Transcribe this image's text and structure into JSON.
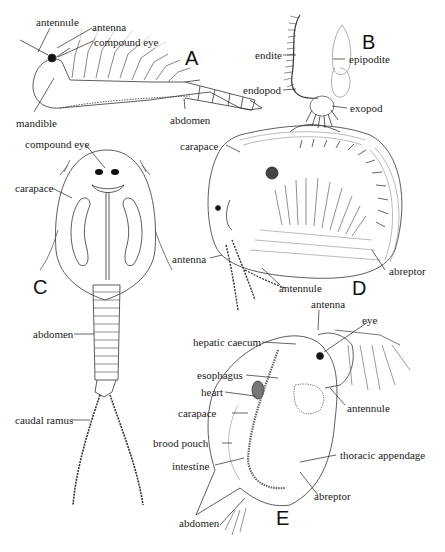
{
  "panels": {
    "A": {
      "letter": "A",
      "labels": [
        "antennule",
        "antenna",
        "compound eye",
        "mandible",
        "abdomen"
      ]
    },
    "B": {
      "letter": "B",
      "labels": [
        "endite",
        "endopod",
        "epipodite",
        "exopod"
      ]
    },
    "C": {
      "letter": "C",
      "labels": [
        "compound eye",
        "carapace",
        "abdomen",
        "caudal ramus"
      ]
    },
    "D": {
      "letter": "D",
      "labels": [
        "carapace",
        "antenna",
        "antennule",
        "abreptor"
      ]
    },
    "E": {
      "letter": "E",
      "labels": [
        "antenna",
        "eye",
        "hepatic caecum",
        "esophagus",
        "heart",
        "antennule",
        "carapace",
        "brood pouch",
        "intestine",
        "thoracic appendage",
        "abreptor",
        "abdomen"
      ]
    }
  }
}
